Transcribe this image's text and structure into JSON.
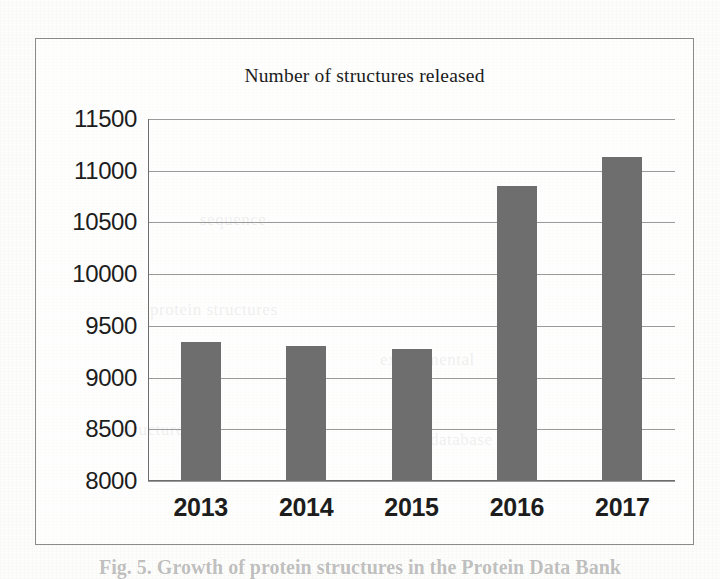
{
  "figure": {
    "caption_partial": "Fig. 5.  Growth of protein structures in the Protein Data Bank"
  },
  "chart_data": {
    "type": "bar",
    "title": "Number of structures released",
    "xlabel": "",
    "ylabel": "",
    "categories": [
      "2013",
      "2014",
      "2015",
      "2016",
      "2017"
    ],
    "values": [
      9340,
      9310,
      9280,
      10850,
      11130
    ],
    "ylim": [
      8000,
      11500
    ],
    "ytick_step": 500,
    "yticks": [
      11500,
      11000,
      10500,
      10000,
      9500,
      9000,
      8500,
      8000
    ],
    "ytick_labels": [
      "11500",
      "11000",
      "10500",
      "10000",
      "9500",
      "9000",
      "8500",
      "8000"
    ],
    "grid": true,
    "grid_axis": "y",
    "legend": false,
    "bar_color": "#6e6e6e",
    "gridline_color": "#9a9a9a",
    "axis_color": "#6d6d6d",
    "text_color": "#1d1d1d",
    "frame_border_color": "#8b8b8b",
    "background_color": "#fdfdfc"
  },
  "bleed_through": [
    {
      "text": "sequence",
      "left": 200,
      "top": 210
    },
    {
      "text": "protein structures",
      "left": 150,
      "top": 300
    },
    {
      "text": "experimental",
      "left": 380,
      "top": 350
    },
    {
      "text": "structure",
      "left": 120,
      "top": 420
    },
    {
      "text": "database",
      "left": 430,
      "top": 430
    }
  ]
}
